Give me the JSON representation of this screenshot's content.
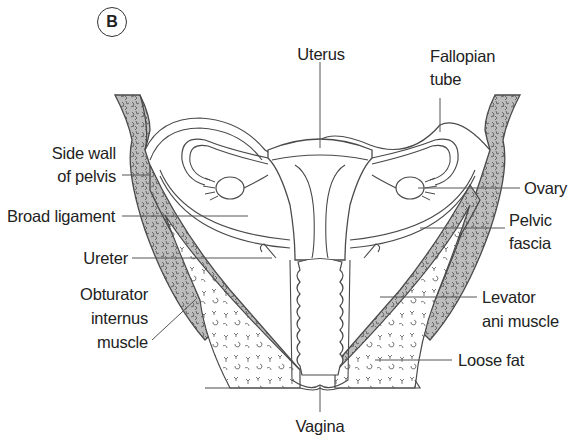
{
  "figure": {
    "panel_label": "B",
    "colors": {
      "outline": "#4a4a4a",
      "muscle_fill": "#b9b9b9",
      "fat_fill": "#ffffff",
      "leader_line": "#555555",
      "text": "#222222"
    }
  },
  "labels": {
    "uterus": "Uterus",
    "fallopian_tube_line1": "Fallopian",
    "fallopian_tube_line2": "tube",
    "side_wall_line1": "Side wall",
    "side_wall_line2": "of pelvis",
    "ovary": "Ovary",
    "broad_ligament": "Broad ligament",
    "pelvic_fascia_line1": "Pelvic",
    "pelvic_fascia_line2": "fascia",
    "ureter": "Ureter",
    "levator_line1": "Levator",
    "levator_line2": "ani muscle",
    "obturator_line1": "Obturator",
    "obturator_line2": "internus",
    "obturator_line3": "muscle",
    "loose_fat": "Loose fat",
    "vagina": "Vagina"
  }
}
